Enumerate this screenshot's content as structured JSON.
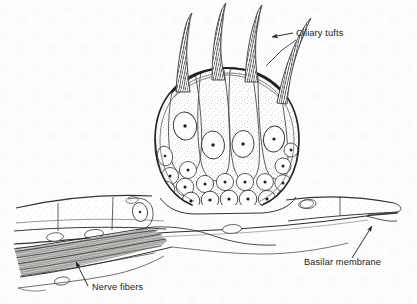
{
  "figure": {
    "background_color": "#fdfdfd",
    "ink_color": "#2b2b2b",
    "stipple_color": "#6b6b6b",
    "width": 417,
    "height": 304
  },
  "labels": [
    {
      "id": "ciliary-tufts",
      "text": "Ciliary tufts",
      "x": 296,
      "y": 36,
      "anchor": "start"
    },
    {
      "id": "basilar-membrane",
      "text": "Basilar membrane",
      "x": 304,
      "y": 265,
      "anchor": "start"
    },
    {
      "id": "nerve-fibers",
      "text": "Nerve fibers",
      "x": 92,
      "y": 290,
      "anchor": "start"
    }
  ],
  "leaders": [
    {
      "id": "ciliary-tufts-leader-upper",
      "from_label": "Ciliary tufts",
      "arrowhead": true,
      "description": "horizontal leader from label left edge to upper right cilium"
    },
    {
      "id": "ciliary-tufts-leader-lower",
      "from_label": "Ciliary tufts",
      "arrowhead": false,
      "description": "diagonal leader down-left toward the rightmost cilium base"
    },
    {
      "id": "basilar-membrane-leader",
      "from_label": "Basilar membrane",
      "arrowhead": true,
      "description": "diagonal leader up-right to the basal membrane line"
    },
    {
      "id": "nerve-fibers-leader",
      "from_label": "Nerve fibers",
      "arrowhead": true,
      "description": "diagonal leader up-left into the dark fiber bundle"
    }
  ],
  "structures": {
    "sensory_bulb": {
      "name": "sensory bulb",
      "center_x": 227,
      "center_y": 140,
      "radius_x": 70,
      "radius_y": 72,
      "outline": "double line, dark",
      "fill": "stippled light"
    },
    "ciliary_tufts": {
      "name": "ciliary tufts",
      "count": 4,
      "texture": "fine cross-hatched striations",
      "description": "curved tapering spikes rising from the apex of the bulb"
    },
    "hair_cells": {
      "name": "columnar hair cells",
      "count": 5,
      "description": "elongated teardrop cells spanning the bulb interior, each with one oval nucleus"
    },
    "hair_cell_nuclei": {
      "name": "hair cell nuclei",
      "count": 5,
      "description": "oval nuclei with a dark central nucleolus"
    },
    "supporting_cells": {
      "name": "basal supporting cells",
      "count": 24,
      "description": "dense row of small round nucleated cells along the base of the bulb"
    },
    "epithelium_left": {
      "name": "left epithelial sheet",
      "cell_count": 3,
      "description": "flat rectangular epithelial cells extending left from the bulb"
    },
    "epithelium_right": {
      "name": "right epithelial sheet",
      "cell_count": 3,
      "description": "flat epithelial cells extending right from the bulb, tapering at the far edge"
    },
    "basilar_membrane": {
      "name": "basilar membrane",
      "description": "thin continuous line running beneath the epithelium across the full width"
    },
    "nerve_fiber_bundle": {
      "name": "nerve fiber bundle",
      "description": "dark dense fibrous band running diagonally from lower left up to the base of the bulb"
    },
    "scattered_nuclei": {
      "name": "scattered subepithelial nuclei",
      "count": 7,
      "description": "small flat oval nuclei below the epithelial layer"
    }
  }
}
